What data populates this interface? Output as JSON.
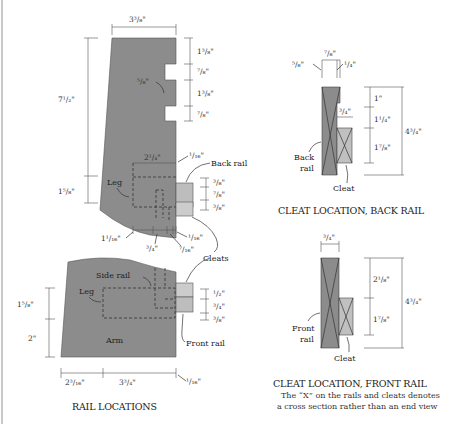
{
  "colors": {
    "wood_dark": "#8c8c8c",
    "wood_light": "#c0c0c0",
    "line": "#333333",
    "background": "#ffffff"
  },
  "rail_locations": {
    "caption": "RAIL LOCATIONS",
    "leg_view": {
      "width_top": "3³/₈\"",
      "height_total": "7¹/₂\"",
      "height_lower": "1⁵/₈\"",
      "notch_dims": [
        "1³/₈\"",
        "⁷/₈\"",
        "1³/₈\"",
        "⁷/₈\""
      ],
      "notch_depth": "⁵/₈\"",
      "rail_width": "2¹/₄\"",
      "rail_offset": "¹/₁₆\"",
      "back_rail_label": "Back rail",
      "leg_label": "Leg",
      "rail_dims": [
        "³/₈\"",
        "⁷/₈\"",
        "³/₈\""
      ],
      "bottom_dims": [
        "1¹/₁₆\"",
        "³/₄\"",
        "⁷/₁₆\"",
        "¹/₁₆\""
      ],
      "cleats_label": "Cleats"
    },
    "arm_view": {
      "side_rail_label": "Side rail",
      "leg_label": "Leg",
      "arm_label": "Arm",
      "front_rail_label": "Front rail",
      "left_dims": [
        "1⁵/₈\"",
        "2\""
      ],
      "rail_dims": [
        "¹/₂\"",
        "³/₄\"",
        "³/₈\""
      ],
      "bottom_dims": [
        "2³/₁₆\"",
        "3³/₄\"",
        "¹/₁₆\""
      ]
    }
  },
  "cleat_back": {
    "caption": "CLEAT LOCATION, BACK RAIL",
    "top_width": "⁷/₈\"",
    "left_dim": "⁵/₈\"",
    "right_dim": "¹/₄\"",
    "cleat_width": "³/₄\"",
    "heights": [
      "1\"",
      "1¹/₄\"",
      "1⁷/₈\""
    ],
    "total_height": "4³/₄\"",
    "rail_label_1": "Back",
    "rail_label_2": "rail",
    "cleat_label": "Cleat"
  },
  "cleat_front": {
    "caption": "CLEAT LOCATION, FRONT RAIL",
    "top_width": "³/₄\"",
    "heights": [
      "2¹/₈\"",
      "1⁷/₈\""
    ],
    "total_height": "4³/₄\"",
    "rail_label_1": "Front",
    "rail_label_2": "rail",
    "cleat_label": "Cleat",
    "note_line_1": "The “X” on the rails and cleats denotes",
    "note_line_2": "a cross section rather than an end view"
  }
}
